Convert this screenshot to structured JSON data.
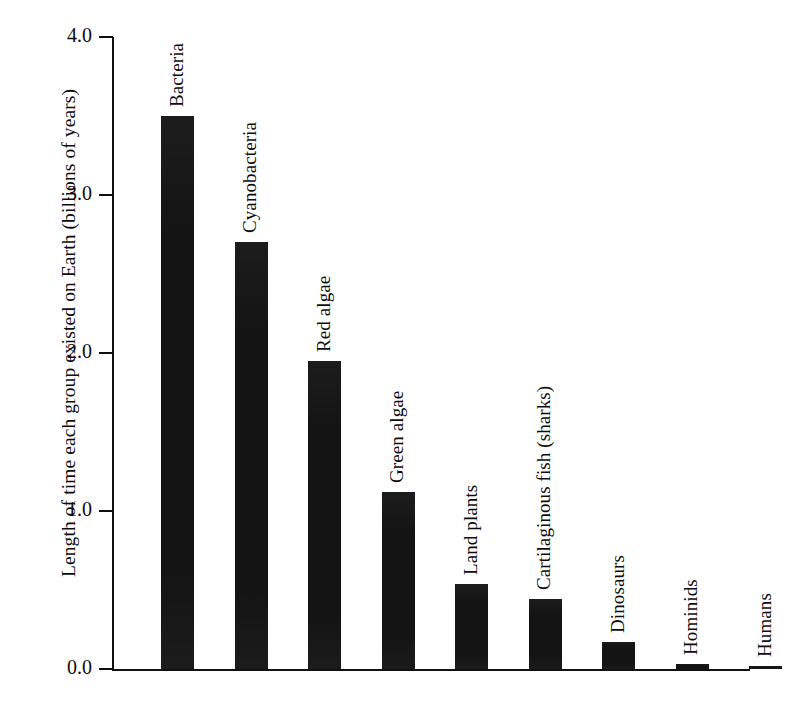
{
  "chart_data": {
    "type": "bar",
    "title": "",
    "subtitle": "",
    "xlabel": "",
    "ylabel": "Length of time each group existed on Earth (billions of years)",
    "ylim": [
      0.0,
      4.0
    ],
    "yticks": [
      "0.0",
      "1.0",
      "2.0",
      "3.0",
      "4.0"
    ],
    "ytick_values": [
      0.0,
      1.0,
      2.0,
      3.0,
      4.0
    ],
    "grid": false,
    "legend": false,
    "legend_position": "none",
    "orientation": "vertical",
    "bar_color": "#141414",
    "axis_color": "#111111",
    "background_color": "#ffffff",
    "categories": [
      "Bacteria",
      "Cyanobacteria",
      "Red algae",
      "Green algae",
      "Land plants",
      "Cartilaginous fish (sharks)",
      "Dinosaurs",
      "Hominids",
      "Humans"
    ],
    "values": [
      3.5,
      2.7,
      1.95,
      1.12,
      0.54,
      0.44,
      0.17,
      0.03,
      0.02
    ],
    "value_unit": "billions of years",
    "annotations": []
  },
  "axis": {
    "y_title": "Length of time each group existed on Earth (billions of years)",
    "ticks": [
      {
        "label": "4.0",
        "value": 4.0
      },
      {
        "label": "3.0",
        "value": 3.0
      },
      {
        "label": "2.0",
        "value": 2.0
      },
      {
        "label": "1.0",
        "value": 1.0
      },
      {
        "label": "0.0",
        "value": 0.0
      }
    ]
  },
  "bars": [
    {
      "label": "Bacteria",
      "value": 3.5
    },
    {
      "label": "Cyanobacteria",
      "value": 2.7
    },
    {
      "label": "Red algae",
      "value": 1.95
    },
    {
      "label": "Green algae",
      "value": 1.12
    },
    {
      "label": "Land plants",
      "value": 0.54
    },
    {
      "label": "Cartilaginous fish (sharks)",
      "value": 0.44
    },
    {
      "label": "Dinosaurs",
      "value": 0.17
    },
    {
      "label": "Hominids",
      "value": 0.03
    },
    {
      "label": "Humans",
      "value": 0.02
    }
  ]
}
